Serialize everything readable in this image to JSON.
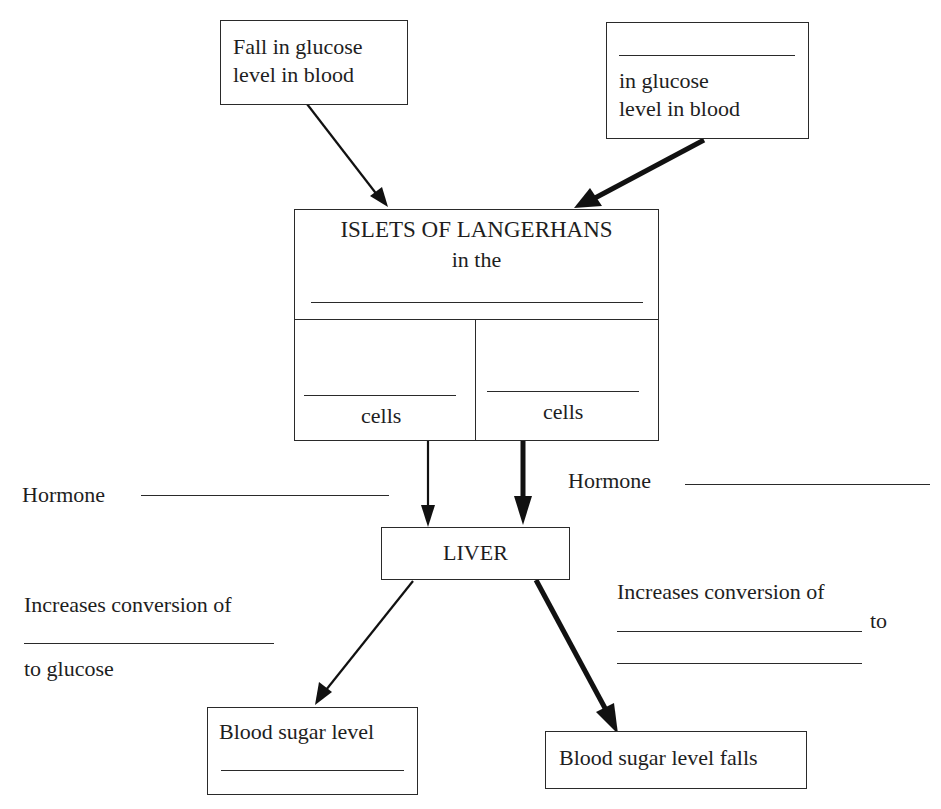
{
  "diagram": {
    "colors": {
      "ink": "#1e1e1e",
      "paper": "#ffffff"
    },
    "top_left_box": {
      "lines": [
        "Fall in glucose",
        "level in blood"
      ]
    },
    "top_right_box": {
      "blank": "",
      "lines": [
        "in glucose",
        "level in blood"
      ]
    },
    "islets_box": {
      "title": "ISLETS OF LANGERHANS",
      "subtitle": "in the",
      "blank": "",
      "left_cell": {
        "blank": "",
        "label": "cells"
      },
      "right_cell": {
        "blank": "",
        "label": "cells"
      }
    },
    "hormone_left": {
      "label": "Hormone",
      "blank": ""
    },
    "hormone_right": {
      "label": "Hormone",
      "blank": ""
    },
    "liver_box": {
      "label": "LIVER"
    },
    "left_conversion": {
      "line1": "Increases conversion of",
      "blank": "",
      "line3": "to glucose"
    },
    "right_conversion": {
      "line1": "Increases conversion of",
      "blank1": "",
      "to_word": "to",
      "blank2": ""
    },
    "bottom_left_box": {
      "label": "Blood sugar level",
      "blank": ""
    },
    "bottom_right_box": {
      "label": "Blood sugar level falls"
    },
    "arrows": [
      {
        "from": "top_left_box",
        "to": "islets_box",
        "weight": "thin"
      },
      {
        "from": "top_right_box",
        "to": "islets_box",
        "weight": "thick"
      },
      {
        "from": "islets_left_cell",
        "to": "liver_box",
        "weight": "thin"
      },
      {
        "from": "islets_right_cell",
        "to": "liver_box",
        "weight": "thick"
      },
      {
        "from": "liver_box",
        "to": "bottom_left_box",
        "weight": "thin"
      },
      {
        "from": "liver_box",
        "to": "bottom_right_box",
        "weight": "thick"
      }
    ]
  }
}
